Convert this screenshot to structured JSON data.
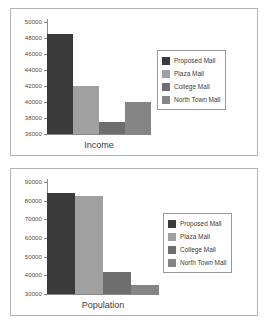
{
  "figure": {
    "background_color": "#ffffff",
    "panel_border_color": "#b4b4b4"
  },
  "series_colors": {
    "proposed_mall": "#3a3a3a",
    "plaza_mall": "#a0a0a0",
    "college_mall": "#6e6e6e",
    "north_town_mall": "#858585"
  },
  "legend": {
    "items": [
      {
        "label": "Proposed Mall",
        "color": "#3a3a3a"
      },
      {
        "label": "Plaza Mall",
        "color": "#a0a0a0"
      },
      {
        "label": "College Mall",
        "color": "#6e6e6e"
      },
      {
        "label": "North Town Mall",
        "color": "#858585"
      }
    ]
  },
  "chart_data": [
    {
      "type": "bar",
      "title": "",
      "xlabel": "Income",
      "ylabel": "",
      "categories": [
        "Proposed Mall",
        "Plaza Mall",
        "College Mall",
        "North Town Mall"
      ],
      "values": [
        48500,
        42000,
        37500,
        40000
      ],
      "colors": [
        "#3a3a3a",
        "#a0a0a0",
        "#6e6e6e",
        "#858585"
      ],
      "ylim": [
        36000,
        50000
      ],
      "yticks": [
        36000,
        38000,
        40000,
        42000,
        44000,
        46000,
        48000,
        50000
      ],
      "ytick_labels": [
        "36000",
        "38000",
        "40000",
        "42000",
        "44000",
        "46000",
        "48000",
        "50000"
      ],
      "grid": false,
      "legend_position": "right"
    },
    {
      "type": "bar",
      "title": "",
      "xlabel": "Population",
      "ylabel": "",
      "categories": [
        "Proposed Mall",
        "Plaza Mall",
        "College Mall",
        "North Town Mall"
      ],
      "values": [
        84000,
        82500,
        42000,
        35000
      ],
      "colors": [
        "#3a3a3a",
        "#a0a0a0",
        "#6e6e6e",
        "#858585"
      ],
      "ylim": [
        30000,
        90000
      ],
      "yticks": [
        30000,
        40000,
        50000,
        60000,
        70000,
        80000,
        90000
      ],
      "ytick_labels": [
        "30000",
        "40000",
        "50000",
        "60000",
        "70000",
        "80000",
        "90000"
      ],
      "grid": false,
      "legend_position": "right"
    }
  ]
}
